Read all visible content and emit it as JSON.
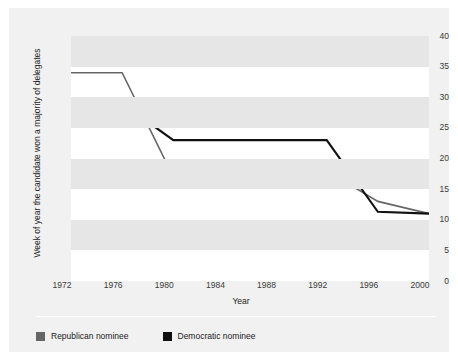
{
  "figure": {
    "title_clipped": "",
    "background": "#f1f1f1",
    "plot_background": "#ffffff",
    "band_color": "#e6e6e6"
  },
  "legend": {
    "position": "bottom-left",
    "items": [
      {
        "label": "Republican nominee",
        "color": "#666666",
        "name": "republican"
      },
      {
        "label": "Democratic nominee",
        "color": "#111111",
        "name": "democratic"
      }
    ]
  },
  "chart_data": {
    "type": "line",
    "title": "",
    "xlabel": "Year",
    "ylabel": "Week of year the candidate won a majority of delegates",
    "categories": [
      1972,
      1976,
      1980,
      1984,
      1988,
      1992,
      1996,
      2000
    ],
    "x_tick_labels": [
      "1972",
      "1976",
      "1980",
      "1984",
      "1988",
      "1992",
      "1996",
      "2000"
    ],
    "y_tick_labels": [
      "0",
      "5",
      "10",
      "15",
      "20",
      "25",
      "30",
      "35",
      "40"
    ],
    "y_ticks": [
      0,
      5,
      10,
      15,
      20,
      25,
      30,
      35,
      40
    ],
    "ylim": [
      0,
      40
    ],
    "xlim": [
      1972,
      2000
    ],
    "grid": false,
    "banded_background": true,
    "band_step": 5,
    "legend_position": "below-axes",
    "series": [
      {
        "name": "Republican nominee",
        "color": "#666666",
        "values": [
          34,
          34,
          17,
          19,
          17,
          18,
          13,
          11
        ]
      },
      {
        "name": "Democratic nominee",
        "color": "#111111",
        "values": [
          28,
          29,
          23,
          23,
          23,
          23,
          11.3,
          11
        ]
      }
    ]
  }
}
